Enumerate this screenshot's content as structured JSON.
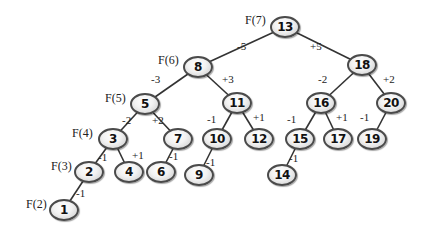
{
  "diagram": {
    "type": "binary-search-tree",
    "colors": {
      "edge": "#333333",
      "node_border": "#4a4a4a",
      "node_fill": "#eeeeee",
      "text": "#111111"
    },
    "nodes": [
      {
        "id": "13",
        "label": "13",
        "x": 285,
        "y": 27
      },
      {
        "id": "8",
        "label": "8",
        "x": 198,
        "y": 67
      },
      {
        "id": "18",
        "label": "18",
        "x": 362,
        "y": 65
      },
      {
        "id": "5",
        "label": "5",
        "x": 145,
        "y": 104
      },
      {
        "id": "11",
        "label": "11",
        "x": 237,
        "y": 103
      },
      {
        "id": "16",
        "label": "16",
        "x": 321,
        "y": 103
      },
      {
        "id": "20",
        "label": "20",
        "x": 391,
        "y": 103
      },
      {
        "id": "3",
        "label": "3",
        "x": 113,
        "y": 139
      },
      {
        "id": "7",
        "label": "7",
        "x": 178,
        "y": 139
      },
      {
        "id": "10",
        "label": "10",
        "x": 217,
        "y": 139
      },
      {
        "id": "12",
        "label": "12",
        "x": 259,
        "y": 139
      },
      {
        "id": "15",
        "label": "15",
        "x": 300,
        "y": 139
      },
      {
        "id": "17",
        "label": "17",
        "x": 338,
        "y": 139
      },
      {
        "id": "19",
        "label": "19",
        "x": 372,
        "y": 139
      },
      {
        "id": "2",
        "label": "2",
        "x": 89,
        "y": 172
      },
      {
        "id": "4",
        "label": "4",
        "x": 129,
        "y": 172
      },
      {
        "id": "6",
        "label": "6",
        "x": 161,
        "y": 172
      },
      {
        "id": "9",
        "label": "9",
        "x": 199,
        "y": 175
      },
      {
        "id": "14",
        "label": "14",
        "x": 282,
        "y": 175
      },
      {
        "id": "1",
        "label": "1",
        "x": 64,
        "y": 210
      }
    ],
    "edges": [
      {
        "from": "13",
        "to": "8",
        "label": "-5",
        "lx": 237,
        "ly": 41
      },
      {
        "from": "13",
        "to": "18",
        "label": "+5",
        "lx": 310,
        "ly": 41
      },
      {
        "from": "8",
        "to": "5",
        "label": "-3",
        "lx": 151,
        "ly": 74
      },
      {
        "from": "8",
        "to": "11",
        "label": "+3",
        "lx": 222,
        "ly": 74
      },
      {
        "from": "18",
        "to": "16",
        "label": "-2",
        "lx": 318,
        "ly": 74
      },
      {
        "from": "18",
        "to": "20",
        "label": "+2",
        "lx": 383,
        "ly": 74
      },
      {
        "from": "5",
        "to": "3",
        "label": "-2",
        "lx": 122,
        "ly": 115
      },
      {
        "from": "5",
        "to": "7",
        "label": "+2",
        "lx": 152,
        "ly": 115
      },
      {
        "from": "11",
        "to": "10",
        "label": "-1",
        "lx": 207,
        "ly": 114
      },
      {
        "from": "11",
        "to": "12",
        "label": "+1",
        "lx": 253,
        "ly": 112
      },
      {
        "from": "16",
        "to": "15",
        "label": "-1",
        "lx": 287,
        "ly": 114
      },
      {
        "from": "16",
        "to": "17",
        "label": "+1",
        "lx": 336,
        "ly": 112
      },
      {
        "from": "20",
        "to": "19",
        "label": "-1",
        "lx": 360,
        "ly": 112
      },
      {
        "from": "3",
        "to": "2",
        "label": "-1",
        "lx": 98,
        "ly": 152
      },
      {
        "from": "3",
        "to": "4",
        "label": "+1",
        "lx": 132,
        "ly": 150
      },
      {
        "from": "7",
        "to": "6",
        "label": "-1",
        "lx": 169,
        "ly": 151
      },
      {
        "from": "10",
        "to": "9",
        "label": "-1",
        "lx": 206,
        "ly": 157
      },
      {
        "from": "15",
        "to": "14",
        "label": "-1",
        "lx": 289,
        "ly": 153
      },
      {
        "from": "2",
        "to": "1",
        "label": "-1",
        "lx": 76,
        "ly": 188
      }
    ],
    "fib_labels": [
      {
        "node": "13",
        "label": "F(7)",
        "x": 245,
        "y": 14
      },
      {
        "node": "8",
        "label": "F(6)",
        "x": 158,
        "y": 54
      },
      {
        "node": "5",
        "label": "F(5)",
        "x": 105,
        "y": 92
      },
      {
        "node": "3",
        "label": "F(4)",
        "x": 72,
        "y": 127
      },
      {
        "node": "2",
        "label": "F(3)",
        "x": 51,
        "y": 160
      },
      {
        "node": "1",
        "label": "F(2)",
        "x": 26,
        "y": 198
      }
    ]
  }
}
